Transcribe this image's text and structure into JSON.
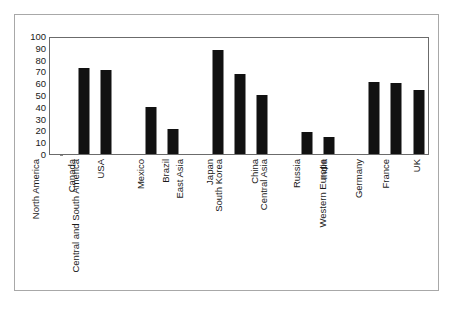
{
  "chart_data": {
    "type": "bar",
    "title": "",
    "subtitle": "",
    "xlabel": "",
    "ylabel": "",
    "ylim": [
      0,
      100
    ],
    "xlim_categories": 17,
    "grid": false,
    "legend": false,
    "legend_position": "none",
    "y_ticks": [
      0,
      10,
      20,
      30,
      40,
      50,
      60,
      70,
      80,
      90,
      100
    ],
    "y_tick_labels": [
      "0",
      "10",
      "20",
      "30",
      "40",
      "50",
      "60",
      "70",
      "80",
      "90",
      "100"
    ],
    "bar_color": "#111111",
    "axis_color": "#6b6b6b",
    "frame_color": "#a8a8a8",
    "categories": [
      "North America",
      "Canada",
      "USA",
      "Central and South America",
      "Mexico",
      "Brazil",
      "East Asia",
      "Japan",
      "South Korea",
      "China",
      "Central Asia",
      "Russia",
      "India",
      "Western Europe",
      "Germany",
      "France",
      "UK"
    ],
    "values": [
      0,
      73,
      71,
      0,
      40,
      21.5,
      0,
      88,
      68,
      50,
      0,
      18.5,
      14.5,
      0,
      61,
      60,
      54
    ],
    "series": [
      {
        "name": "",
        "values": [
          0,
          73,
          71,
          0,
          40,
          21.5,
          0,
          88,
          68,
          50,
          0,
          18.5,
          14.5,
          0,
          61,
          60,
          54
        ]
      }
    ]
  }
}
